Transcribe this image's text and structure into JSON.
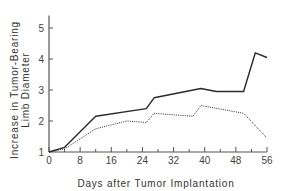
{
  "chart_data": {
    "type": "line",
    "title": "",
    "xlabel": "Days after Tumor Implantation",
    "ylabel": [
      "Increase in Tumor-Bearing",
      "Limb Diameter"
    ],
    "xlim": [
      0,
      56
    ],
    "ylim": [
      1,
      5.4
    ],
    "xticks": [
      0,
      8,
      16,
      24,
      32,
      40,
      48,
      56
    ],
    "xminor_ticks": [
      4,
      12,
      20,
      28,
      36,
      44,
      52
    ],
    "yticks": [
      1,
      2,
      3,
      4,
      5
    ],
    "grid": false,
    "legend": null,
    "series": [
      {
        "name": "solid",
        "style": "solid",
        "x": [
          0,
          4,
          12,
          25,
          27,
          39,
          43,
          50,
          53,
          56
        ],
        "values": [
          1.0,
          1.15,
          2.15,
          2.4,
          2.75,
          3.05,
          2.95,
          2.95,
          4.2,
          4.05
        ]
      },
      {
        "name": "dotted",
        "style": "dotted",
        "x": [
          0,
          4,
          12,
          20,
          25,
          27,
          37,
          39,
          50,
          56
        ],
        "values": [
          1.0,
          1.1,
          1.75,
          2.0,
          1.95,
          2.25,
          2.15,
          2.5,
          2.25,
          1.45
        ]
      }
    ]
  },
  "colors": {
    "line": "#2a2a2a",
    "axis": "#555555"
  }
}
